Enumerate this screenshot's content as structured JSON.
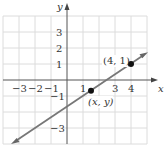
{
  "diagram": {
    "type": "coordinate-plane",
    "axes": {
      "x_label": "x",
      "y_label": "y",
      "x_ticks": [
        {
          "value": -3,
          "label": "−3"
        },
        {
          "value": -2,
          "label": "−2"
        },
        {
          "value": -1,
          "label": "−1"
        },
        {
          "value": 1,
          "label": "1"
        },
        {
          "value": 3,
          "label": "3"
        },
        {
          "value": 4,
          "label": "4"
        }
      ],
      "y_ticks": [
        {
          "value": 3,
          "label": "3"
        },
        {
          "value": 2,
          "label": "2"
        },
        {
          "value": 1,
          "label": "1"
        },
        {
          "value": -1,
          "label": "−1"
        },
        {
          "value": -3,
          "label": "−3"
        }
      ],
      "x_range": [
        -4,
        5
      ],
      "y_range": [
        -4,
        4
      ]
    },
    "line": {
      "description": "line through (4, 1) with slope 2/3",
      "color": "#777777"
    },
    "points": [
      {
        "x": 4,
        "y": 1,
        "label": "(4, 1)"
      },
      {
        "x": 1.5,
        "y": -0.67,
        "label": "(x, y)"
      }
    ],
    "colors": {
      "grid": "#dcdcdc",
      "axis": "#555555",
      "point": "#111111"
    }
  }
}
